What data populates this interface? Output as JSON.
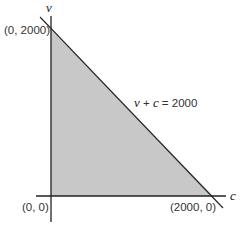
{
  "diagram": {
    "axes": {
      "x_label": "c",
      "y_label": "v"
    },
    "points": [
      {
        "label": "(0, 2000)"
      },
      {
        "label": "(0, 0)"
      },
      {
        "label": "(2000, 0)"
      }
    ],
    "line_label": {
      "lhs_v": "v",
      "plus": " + ",
      "lhs_c": "c",
      "rhs": " = 2000"
    },
    "colors": {
      "fill": "#c8c8c8",
      "line": "#222222",
      "axis": "#222222"
    }
  }
}
